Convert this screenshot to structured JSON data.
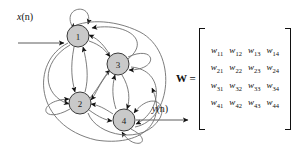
{
  "figure": {
    "type": "recurrent-neural-network-graph",
    "input_label": {
      "var": "x",
      "arg": "(n)"
    },
    "output_label": {
      "var": "y",
      "arg": "(n)"
    },
    "nodes": [
      {
        "id": "1",
        "label": "1",
        "cx": 78,
        "cy": 36,
        "r": 11
      },
      {
        "id": "2",
        "label": "2",
        "cx": 80,
        "cy": 103,
        "r": 11
      },
      {
        "id": "3",
        "label": "3",
        "cx": 118,
        "cy": 64,
        "r": 11
      },
      {
        "id": "4",
        "label": "4",
        "cx": 124,
        "cy": 120,
        "r": 11
      }
    ],
    "node_fill": "#c9c9c9",
    "node_stroke": "#3a3a3a",
    "edge_color": "#6e6e6e",
    "arrow_color": "#111111",
    "self_loops": [
      "1",
      "2",
      "3",
      "4"
    ],
    "edges": [
      "1->2",
      "2->1",
      "1->3",
      "3->1",
      "1->4",
      "4->1",
      "2->3",
      "3->2",
      "2->4",
      "4->2",
      "3->4",
      "4->3"
    ]
  },
  "matrix": {
    "name": "W",
    "equals": "=",
    "symbol": "w",
    "rows": [
      [
        {
          "sym": "w",
          "sub": "11"
        },
        {
          "sym": "w",
          "sub": "12"
        },
        {
          "sym": "w",
          "sub": "13"
        },
        {
          "sym": "w",
          "sub": "14"
        }
      ],
      [
        {
          "sym": "w",
          "sub": "21"
        },
        {
          "sym": "w",
          "sub": "22"
        },
        {
          "sym": "w",
          "sub": "23"
        },
        {
          "sym": "w",
          "sub": "24"
        }
      ],
      [
        {
          "sym": "w",
          "sub": "31"
        },
        {
          "sym": "w",
          "sub": "32"
        },
        {
          "sym": "w",
          "sub": "33"
        },
        {
          "sym": "w",
          "sub": "34"
        }
      ],
      [
        {
          "sym": "w",
          "sub": "41"
        },
        {
          "sym": "w",
          "sub": "42"
        },
        {
          "sym": "w",
          "sub": "43"
        },
        {
          "sym": "w",
          "sub": "44"
        }
      ]
    ]
  },
  "colors": {
    "node_fill": "#c9c9c9",
    "edge": "#6e6e6e",
    "text": "#111111",
    "background": "#ffffff"
  }
}
